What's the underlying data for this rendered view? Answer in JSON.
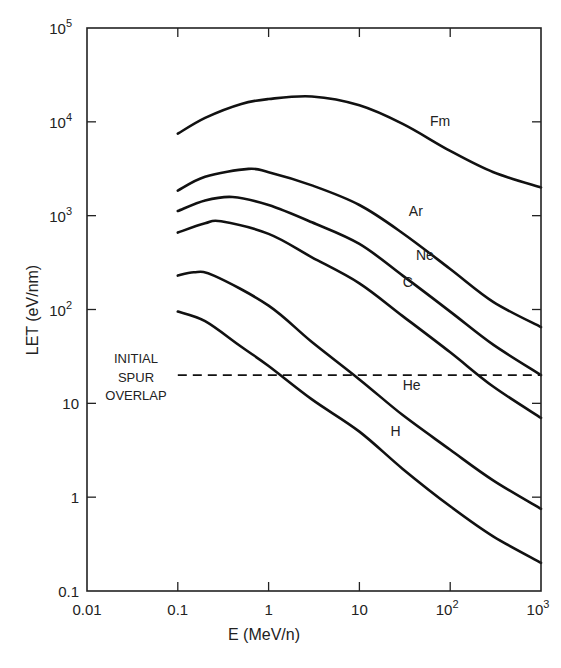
{
  "chart_data": {
    "type": "line",
    "title": "",
    "xlabel": "E (MeV/n)",
    "ylabel": "LET (eV/nm)",
    "xscale": "log",
    "yscale": "log",
    "xlim": [
      0.01,
      1000
    ],
    "ylim": [
      0.1,
      100000
    ],
    "grid": false,
    "legend": "inline labels",
    "x_ticks": [
      {
        "value": 0.01,
        "label": "0.01"
      },
      {
        "value": 0.1,
        "label": "0.1"
      },
      {
        "value": 1,
        "label": "1"
      },
      {
        "value": 10,
        "label": "10"
      },
      {
        "value": 100,
        "label": "10",
        "sup": "2"
      },
      {
        "value": 1000,
        "label": "10",
        "sup": "3"
      }
    ],
    "y_ticks": [
      {
        "value": 0.1,
        "label": "0.1"
      },
      {
        "value": 1,
        "label": "1"
      },
      {
        "value": 10,
        "label": "10"
      },
      {
        "value": 100,
        "label": "10",
        "sup": "2"
      },
      {
        "value": 1000,
        "label": "10",
        "sup": "3"
      },
      {
        "value": 10000,
        "label": "10",
        "sup": "4"
      },
      {
        "value": 100000,
        "label": "10",
        "sup": "5"
      }
    ],
    "series": [
      {
        "name": "Fm",
        "label_at": [
          60,
          9000
        ],
        "points": [
          [
            0.1,
            7500
          ],
          [
            0.2,
            11000
          ],
          [
            0.5,
            15500
          ],
          [
            1,
            17500
          ],
          [
            3,
            18600
          ],
          [
            10,
            15000
          ],
          [
            30,
            9500
          ],
          [
            100,
            4900
          ],
          [
            300,
            2900
          ],
          [
            1000,
            2000
          ]
        ]
      },
      {
        "name": "Ar",
        "label_at": [
          35,
          1000
        ],
        "points": [
          [
            0.1,
            1850
          ],
          [
            0.2,
            2600
          ],
          [
            0.6,
            3150
          ],
          [
            1,
            2900
          ],
          [
            3,
            2100
          ],
          [
            10,
            1300
          ],
          [
            30,
            650
          ],
          [
            100,
            270
          ],
          [
            300,
            120
          ],
          [
            1000,
            65
          ]
        ]
      },
      {
        "name": "Ne",
        "label_at": [
          42,
          340
        ],
        "points": [
          [
            0.1,
            1120
          ],
          [
            0.2,
            1450
          ],
          [
            0.4,
            1580
          ],
          [
            1,
            1300
          ],
          [
            3,
            850
          ],
          [
            10,
            500
          ],
          [
            30,
            230
          ],
          [
            100,
            95
          ],
          [
            300,
            42
          ],
          [
            1000,
            20
          ]
        ]
      },
      {
        "name": "C",
        "label_at": [
          30,
          175
        ],
        "points": [
          [
            0.1,
            660
          ],
          [
            0.2,
            830
          ],
          [
            0.3,
            870
          ],
          [
            1,
            640
          ],
          [
            3,
            360
          ],
          [
            10,
            190
          ],
          [
            30,
            85
          ],
          [
            100,
            35
          ],
          [
            300,
            15
          ],
          [
            1000,
            7
          ]
        ]
      },
      {
        "name": "He",
        "label_at": [
          30,
          14
        ],
        "points": [
          [
            0.1,
            230
          ],
          [
            0.15,
            250
          ],
          [
            0.25,
            230
          ],
          [
            1,
            110
          ],
          [
            3,
            45
          ],
          [
            10,
            18
          ],
          [
            30,
            7.5
          ],
          [
            100,
            3.2
          ],
          [
            300,
            1.5
          ],
          [
            1000,
            0.75
          ]
        ]
      },
      {
        "name": "H",
        "label_at": [
          22,
          4.5
        ],
        "points": [
          [
            0.1,
            95
          ],
          [
            0.2,
            75
          ],
          [
            0.5,
            40
          ],
          [
            1,
            25
          ],
          [
            3,
            11
          ],
          [
            10,
            5
          ],
          [
            30,
            2
          ],
          [
            100,
            0.8
          ],
          [
            300,
            0.38
          ],
          [
            1000,
            0.2
          ]
        ]
      }
    ],
    "reference_lines": [
      {
        "type": "horizontal",
        "y": 20,
        "style": "dashed",
        "x_from": 0.1,
        "x_to": 1000,
        "label": [
          "INITIAL",
          "SPUR",
          "OVERLAP"
        ]
      }
    ]
  }
}
